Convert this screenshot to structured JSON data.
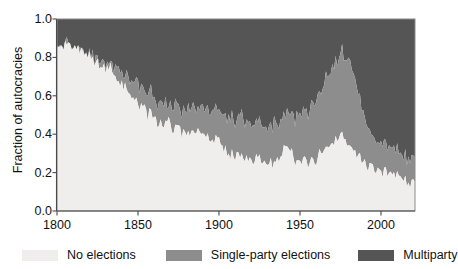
{
  "chart_data": {
    "type": "area",
    "stacked": true,
    "title": "",
    "xlabel": "",
    "ylabel": "Fraction of autocracies",
    "xlim": [
      1800,
      2021
    ],
    "ylim": [
      0.0,
      1.0
    ],
    "grid": false,
    "legend_position": "bottom",
    "xticks": [
      1800,
      1850,
      1900,
      1950,
      2000
    ],
    "xtick_labels": [
      "1800",
      "1850",
      "1900",
      "1950",
      "2000"
    ],
    "yticks": [
      0.0,
      0.2,
      0.4,
      0.6,
      0.8,
      1.0
    ],
    "ytick_labels": [
      "0.0",
      "0.2",
      "0.4",
      "0.6",
      "0.8",
      "1.0"
    ],
    "colors": {
      "no_elections": "#efeeec",
      "single_party": "#8d8d8d",
      "multiparty": "#555555",
      "axis": "#4a4a4a",
      "text": "#111111",
      "background": "#ffffff"
    },
    "x": [
      1800,
      1803,
      1806,
      1809,
      1812,
      1815,
      1818,
      1821,
      1824,
      1827,
      1830,
      1833,
      1836,
      1839,
      1842,
      1845,
      1848,
      1851,
      1854,
      1857,
      1860,
      1863,
      1866,
      1869,
      1872,
      1875,
      1878,
      1881,
      1884,
      1887,
      1890,
      1893,
      1896,
      1899,
      1902,
      1905,
      1908,
      1911,
      1914,
      1917,
      1920,
      1923,
      1926,
      1929,
      1932,
      1935,
      1938,
      1941,
      1944,
      1947,
      1950,
      1953,
      1956,
      1959,
      1962,
      1965,
      1968,
      1971,
      1974,
      1977,
      1980,
      1983,
      1986,
      1989,
      1992,
      1995,
      1998,
      2001,
      2004,
      2007,
      2010,
      2013,
      2016,
      2019,
      2021
    ],
    "series": [
      {
        "name": "No elections",
        "key": "no_elections",
        "values": [
          0.86,
          0.86,
          0.85,
          0.84,
          0.84,
          0.83,
          0.82,
          0.8,
          0.78,
          0.75,
          0.73,
          0.74,
          0.7,
          0.66,
          0.64,
          0.62,
          0.58,
          0.55,
          0.53,
          0.5,
          0.48,
          0.46,
          0.44,
          0.48,
          0.42,
          0.44,
          0.4,
          0.42,
          0.39,
          0.41,
          0.38,
          0.4,
          0.36,
          0.38,
          0.34,
          0.31,
          0.29,
          0.3,
          0.28,
          0.27,
          0.26,
          0.28,
          0.26,
          0.27,
          0.26,
          0.25,
          0.28,
          0.34,
          0.3,
          0.26,
          0.27,
          0.26,
          0.25,
          0.26,
          0.3,
          0.34,
          0.32,
          0.36,
          0.38,
          0.4,
          0.34,
          0.3,
          0.28,
          0.26,
          0.24,
          0.22,
          0.21,
          0.2,
          0.19,
          0.18,
          0.18,
          0.17,
          0.16,
          0.15,
          0.15
        ]
      },
      {
        "name": "Single-party elections",
        "key": "single_party",
        "values": [
          0.0,
          0.0,
          0.0,
          0.0,
          0.0,
          0.0,
          0.0,
          0.0,
          0.01,
          0.03,
          0.03,
          0.02,
          0.04,
          0.07,
          0.06,
          0.08,
          0.09,
          0.1,
          0.09,
          0.11,
          0.1,
          0.12,
          0.11,
          0.09,
          0.13,
          0.12,
          0.14,
          0.12,
          0.15,
          0.13,
          0.16,
          0.14,
          0.17,
          0.15,
          0.17,
          0.18,
          0.19,
          0.18,
          0.2,
          0.19,
          0.18,
          0.17,
          0.19,
          0.18,
          0.2,
          0.21,
          0.19,
          0.16,
          0.19,
          0.22,
          0.23,
          0.25,
          0.28,
          0.3,
          0.32,
          0.34,
          0.38,
          0.4,
          0.42,
          0.44,
          0.44,
          0.4,
          0.34,
          0.28,
          0.2,
          0.16,
          0.15,
          0.14,
          0.14,
          0.13,
          0.13,
          0.13,
          0.13,
          0.13,
          0.13
        ]
      },
      {
        "name": "Multiparty",
        "key": "multiparty",
        "values": [
          0.14,
          0.14,
          0.15,
          0.16,
          0.16,
          0.17,
          0.18,
          0.2,
          0.21,
          0.22,
          0.24,
          0.24,
          0.26,
          0.27,
          0.3,
          0.3,
          0.33,
          0.35,
          0.38,
          0.39,
          0.42,
          0.42,
          0.45,
          0.43,
          0.45,
          0.44,
          0.46,
          0.46,
          0.46,
          0.46,
          0.46,
          0.46,
          0.47,
          0.47,
          0.49,
          0.51,
          0.52,
          0.52,
          0.52,
          0.54,
          0.56,
          0.55,
          0.55,
          0.55,
          0.54,
          0.54,
          0.53,
          0.5,
          0.51,
          0.52,
          0.5,
          0.49,
          0.47,
          0.44,
          0.38,
          0.32,
          0.3,
          0.24,
          0.2,
          0.16,
          0.22,
          0.3,
          0.38,
          0.46,
          0.56,
          0.62,
          0.64,
          0.66,
          0.67,
          0.69,
          0.69,
          0.7,
          0.71,
          0.72,
          0.72
        ]
      }
    ]
  },
  "legend": {
    "items": [
      {
        "label": "No elections",
        "key": "no_elections"
      },
      {
        "label": "Single-party elections",
        "key": "single_party"
      },
      {
        "label": "Multiparty",
        "key": "multiparty"
      }
    ]
  }
}
